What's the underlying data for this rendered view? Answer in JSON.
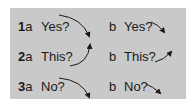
{
  "panel": {
    "background": "#c9c9c9"
  },
  "rows": [
    {
      "number": "1",
      "a_suffix": "a",
      "a_word": "Yes?",
      "b_label": "b",
      "b_word": "Yes?",
      "a_arrow": "curved-falling",
      "b_arrow": "short-falling"
    },
    {
      "number": "2",
      "a_suffix": "a",
      "a_word": "This?",
      "b_label": "b",
      "b_word": "This?",
      "a_arrow": "curved-rising",
      "b_arrow": "rising"
    },
    {
      "number": "3",
      "a_suffix": "a",
      "a_word": "No?",
      "b_label": "b",
      "b_word": "No?",
      "a_arrow": "curved-falling",
      "b_arrow": "short-falling"
    }
  ]
}
